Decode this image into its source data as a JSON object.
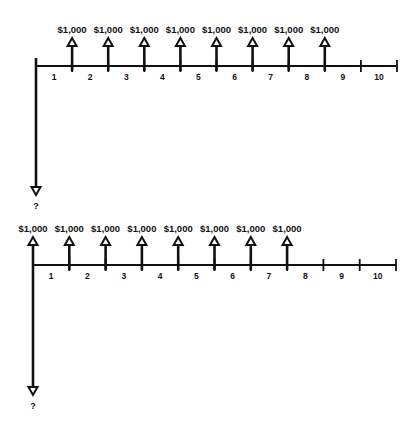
{
  "diagrams": [
    {
      "id": "top",
      "description": "Cash flow diagram: eight $1,000 receipts at end of periods 1-8, unknown present value at time 0",
      "axis": {
        "y": 66,
        "x_start": 36,
        "x_end": 397,
        "period_width": 36.1
      },
      "period_labels": [
        "1",
        "2",
        "3",
        "4",
        "5",
        "6",
        "7",
        "8",
        "9",
        "10"
      ],
      "inflows": [
        {
          "period": 1,
          "label": "$1,000"
        },
        {
          "period": 2,
          "label": "$1,000"
        },
        {
          "period": 3,
          "label": "$1,000"
        },
        {
          "period": 4,
          "label": "$1,000"
        },
        {
          "period": 5,
          "label": "$1,000"
        },
        {
          "period": 6,
          "label": "$1,000"
        },
        {
          "period": 7,
          "label": "$1,000"
        },
        {
          "period": 8,
          "label": "$1,000"
        }
      ],
      "outflow": {
        "period": 0,
        "label": "?",
        "end_y": 195
      }
    },
    {
      "id": "bottom",
      "description": "Cash flow diagram: eight $1,000 receipts at beginning of periods (times 0-7), unknown present value at time 0",
      "axis": {
        "y": 265,
        "x_start": 33,
        "x_end": 396,
        "period_width": 36.3
      },
      "period_labels": [
        "1",
        "2",
        "3",
        "4",
        "5",
        "6",
        "7",
        "8",
        "9",
        "10"
      ],
      "inflows": [
        {
          "period": 0,
          "label": "$1,000"
        },
        {
          "period": 1,
          "label": "$1,000"
        },
        {
          "period": 2,
          "label": "$1,000"
        },
        {
          "period": 3,
          "label": "$1,000"
        },
        {
          "period": 4,
          "label": "$1,000"
        },
        {
          "period": 5,
          "label": "$1,000"
        },
        {
          "period": 6,
          "label": "$1,000"
        },
        {
          "period": 7,
          "label": "$1,000"
        }
      ],
      "outflow": {
        "period": 0,
        "label": "?",
        "end_y": 395
      }
    }
  ],
  "colors": {
    "ink": "#111111",
    "background": "#ffffff"
  }
}
